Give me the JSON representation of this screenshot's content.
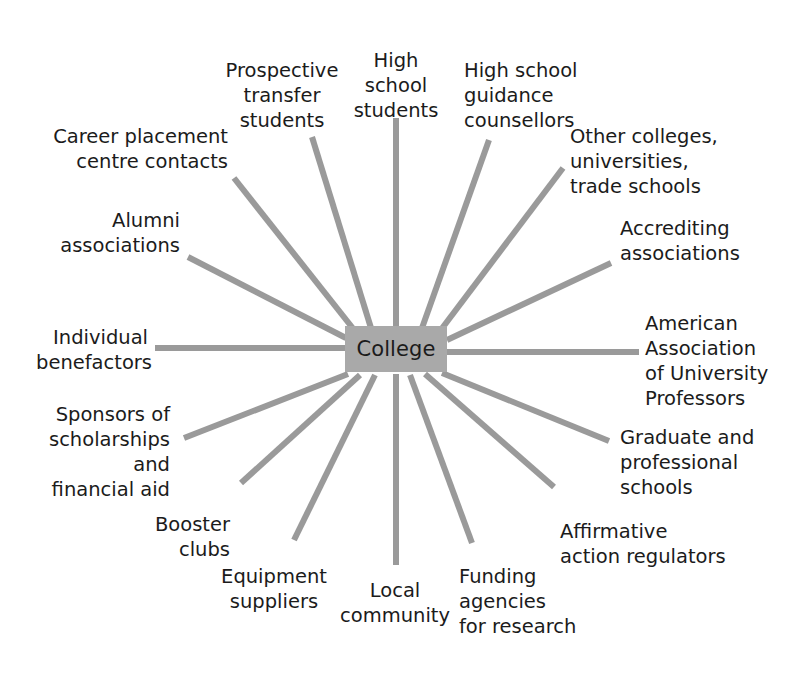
{
  "diagram": {
    "type": "hub-and-spoke",
    "title_text": "",
    "hub": {
      "label": "College",
      "fill_color": "#a9a9a9",
      "text_color": "#1b1b1b",
      "x": 345,
      "y": 326,
      "w": 102,
      "h": 46
    },
    "spoke_color": "#9a9a9a",
    "spoke_width": 6,
    "background_color": "#ffffff",
    "nodes": [
      {
        "id": "high-school-students",
        "label": "High\nschool\nstudents",
        "align": "center",
        "label_x": 316,
        "label_y": 48,
        "label_w": 160,
        "line": {
          "x1": 396,
          "y1": 118,
          "x2": 396,
          "y2": 326
        }
      },
      {
        "id": "prospective-transfer-students",
        "label": "Prospective\ntransfer\nstudents",
        "align": "center",
        "label_x": 212,
        "label_y": 58,
        "label_w": 140,
        "line": {
          "x1": 312,
          "y1": 137,
          "x2": 371,
          "y2": 328
        }
      },
      {
        "id": "career-placement-centre-contacts",
        "label": "Career placement\ncentre contacts",
        "align": "right",
        "label_x": 38,
        "label_y": 124,
        "label_w": 190,
        "line": {
          "x1": 234,
          "y1": 178,
          "x2": 355,
          "y2": 331
        }
      },
      {
        "id": "alumni-associations",
        "label": "Alumni\nassociations",
        "align": "right",
        "label_x": 48,
        "label_y": 208,
        "label_w": 132,
        "line": {
          "x1": 188,
          "y1": 257,
          "x2": 346,
          "y2": 338
        }
      },
      {
        "id": "individual-benefactors",
        "label": "Individual\nbenefactors",
        "align": "right",
        "label_x": 36,
        "label_y": 325,
        "label_w": 112,
        "line": {
          "x1": 155,
          "y1": 348,
          "x2": 346,
          "y2": 348
        }
      },
      {
        "id": "sponsors-of-scholarships",
        "label": "Sponsors of\nscholarships\nand\nfinancial aid",
        "align": "right",
        "label_x": 40,
        "label_y": 402,
        "label_w": 130,
        "line": {
          "x1": 184,
          "y1": 438,
          "x2": 348,
          "y2": 374
        }
      },
      {
        "id": "booster-clubs",
        "label": "Booster\nclubs",
        "align": "right",
        "label_x": 130,
        "label_y": 512,
        "label_w": 100,
        "line": {
          "x1": 241,
          "y1": 483,
          "x2": 360,
          "y2": 375
        }
      },
      {
        "id": "equipment-suppliers",
        "label": "Equipment\nsuppliers",
        "align": "center",
        "label_x": 210,
        "label_y": 564,
        "label_w": 128,
        "line": {
          "x1": 294,
          "y1": 540,
          "x2": 375,
          "y2": 375
        }
      },
      {
        "id": "local-community",
        "label": "Local\ncommunity",
        "align": "center",
        "label_x": 335,
        "label_y": 578,
        "label_w": 120,
        "line": {
          "x1": 396,
          "y1": 565,
          "x2": 396,
          "y2": 374
        }
      },
      {
        "id": "funding-agencies-for-research",
        "label": "Funding\nagencies\nfor research",
        "align": "left",
        "label_x": 459,
        "label_y": 564,
        "label_w": 140,
        "line": {
          "x1": 472,
          "y1": 543,
          "x2": 410,
          "y2": 375
        }
      },
      {
        "id": "affirmative-action-regulators",
        "label": "Affirmative\naction regulators",
        "align": "left",
        "label_x": 560,
        "label_y": 519,
        "label_w": 190,
        "line": {
          "x1": 554,
          "y1": 487,
          "x2": 425,
          "y2": 374
        }
      },
      {
        "id": "graduate-and-professional-schools",
        "label": "Graduate and\nprofessional\nschools",
        "align": "left",
        "label_x": 620,
        "label_y": 425,
        "label_w": 150,
        "line": {
          "x1": 609,
          "y1": 441,
          "x2": 442,
          "y2": 373
        }
      },
      {
        "id": "american-association-of-university-professors",
        "label": "American\nAssociation\nof University\nProfessors",
        "align": "left",
        "label_x": 645,
        "label_y": 311,
        "label_w": 150,
        "line": {
          "x1": 639,
          "y1": 352,
          "x2": 447,
          "y2": 352
        }
      },
      {
        "id": "accrediting-associations",
        "label": "Accrediting\nassociations",
        "align": "left",
        "label_x": 620,
        "label_y": 216,
        "label_w": 140,
        "line": {
          "x1": 611,
          "y1": 263,
          "x2": 447,
          "y2": 340
        }
      },
      {
        "id": "other-colleges-universities-trade-schools",
        "label": "Other colleges,\nuniversities,\ntrade schools",
        "align": "left",
        "label_x": 570,
        "label_y": 124,
        "label_w": 180,
        "line": {
          "x1": 563,
          "y1": 168,
          "x2": 440,
          "y2": 331
        }
      },
      {
        "id": "high-school-guidance-counsellors",
        "label": "High school\nguidance\ncounsellors",
        "align": "left",
        "label_x": 464,
        "label_y": 58,
        "label_w": 150,
        "line": {
          "x1": 489,
          "y1": 140,
          "x2": 422,
          "y2": 328
        }
      }
    ]
  }
}
